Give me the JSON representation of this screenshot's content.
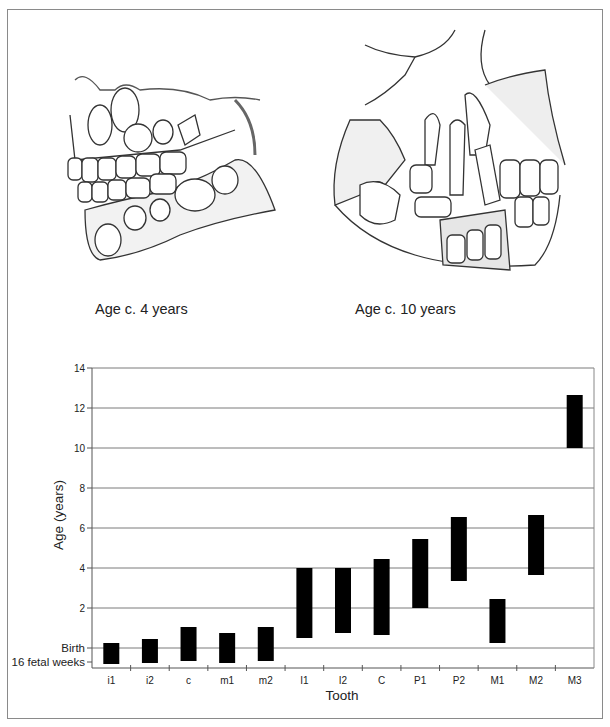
{
  "illustrations": [
    {
      "caption": "Age c. 4 years",
      "subject": "child-skull-jaws-with-developing-teeth"
    },
    {
      "caption": "Age c. 10 years",
      "subject": "child-skull-mixed-dentition"
    }
  ],
  "chart_data": {
    "type": "bar",
    "subtype": "floating-range-bar",
    "title": "",
    "xlabel": "Tooth",
    "ylabel": "Age (years)",
    "categories": [
      "i1",
      "i2",
      "c",
      "m1",
      "m2",
      "I1",
      "I2",
      "C",
      "P1",
      "P2",
      "M1",
      "M2",
      "M3"
    ],
    "series": [
      {
        "name": "Crown formation period",
        "color": "#000000",
        "start": [
          -0.8,
          -0.75,
          -0.65,
          -0.75,
          -0.65,
          0.5,
          0.75,
          0.65,
          2.0,
          3.35,
          0.25,
          3.65,
          10.0
        ],
        "end": [
          0.25,
          0.45,
          1.05,
          0.75,
          1.05,
          4.0,
          4.0,
          4.45,
          5.45,
          6.55,
          2.45,
          6.65,
          12.65
        ]
      }
    ],
    "yticks": [
      {
        "value": 14,
        "label": "14"
      },
      {
        "value": 12,
        "label": "12"
      },
      {
        "value": 10,
        "label": "10"
      },
      {
        "value": 8,
        "label": "8"
      },
      {
        "value": 6,
        "label": "6"
      },
      {
        "value": 4,
        "label": "4"
      },
      {
        "value": 2,
        "label": "2"
      },
      {
        "value": 0,
        "label": "Birth"
      },
      {
        "value": -0.7,
        "label": "16 fetal weeks"
      }
    ],
    "ylim": [
      -1.0,
      14
    ],
    "grid": true,
    "legend": null
  }
}
